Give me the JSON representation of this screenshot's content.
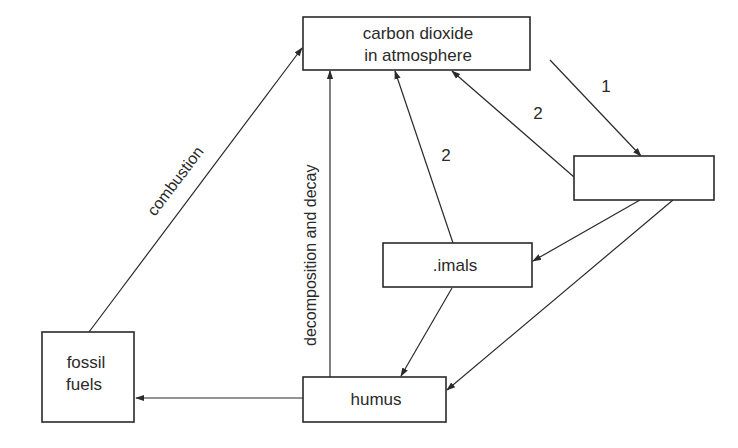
{
  "diagram": {
    "type": "carbon-cycle-flow",
    "nodes": {
      "co2": {
        "line1": "carbon dioxide",
        "line2": "in atmosphere"
      },
      "unlabeled": {
        "label": ""
      },
      "animals": {
        "label": ".imals"
      },
      "fossil": {
        "line1": "fossil",
        "line2": "fuels"
      },
      "humus": {
        "label": "humus"
      }
    },
    "edges": [
      {
        "id": "e1",
        "from": "co2",
        "to": "unlabeled",
        "label": "1"
      },
      {
        "id": "e2",
        "from": "unlabeled",
        "to": "co2",
        "label": "2"
      },
      {
        "id": "e3",
        "from": "animals",
        "to": "co2",
        "label": "2"
      },
      {
        "id": "e4",
        "from": "unlabeled",
        "to": "animals",
        "label": ""
      },
      {
        "id": "e5",
        "from": "unlabeled",
        "to": "humus",
        "label": ""
      },
      {
        "id": "e6",
        "from": "animals",
        "to": "humus",
        "label": ""
      },
      {
        "id": "e7",
        "from": "humus",
        "to": "co2",
        "label": "decomposition and decay"
      },
      {
        "id": "e8",
        "from": "humus",
        "to": "fossil",
        "label": ""
      },
      {
        "id": "e9",
        "from": "fossil",
        "to": "co2",
        "label": "combustion"
      }
    ],
    "colors": {
      "ink": "#2a2a2a",
      "background": "#ffffff"
    }
  }
}
